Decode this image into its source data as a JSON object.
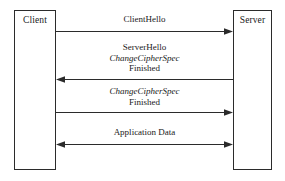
{
  "diagram": {
    "type": "sequence-diagram",
    "colors": {
      "background": "#ffffff",
      "line": "#2b2b2b",
      "text": "#1a1a1a"
    },
    "parties": [
      {
        "id": "client",
        "label": "Client"
      },
      {
        "id": "server",
        "label": "Server"
      }
    ],
    "messages": [
      {
        "id": "clienthello",
        "direction": "client-to-server",
        "lines": [
          {
            "text": "ClientHello",
            "italic": false
          }
        ]
      },
      {
        "id": "serverhello",
        "direction": "server-to-client",
        "lines": [
          {
            "text": "ServerHello",
            "italic": false
          },
          {
            "text": "ChangeCipherSpec",
            "italic": true
          },
          {
            "text": "Finished",
            "italic": false
          }
        ]
      },
      {
        "id": "client-ccs",
        "direction": "client-to-server",
        "lines": [
          {
            "text": "ChangeCipherSpec",
            "italic": true
          },
          {
            "text": "Finished",
            "italic": false
          }
        ]
      },
      {
        "id": "appdata",
        "direction": "bidirectional",
        "lines": [
          {
            "text": "Application Data",
            "italic": false
          }
        ]
      }
    ]
  }
}
